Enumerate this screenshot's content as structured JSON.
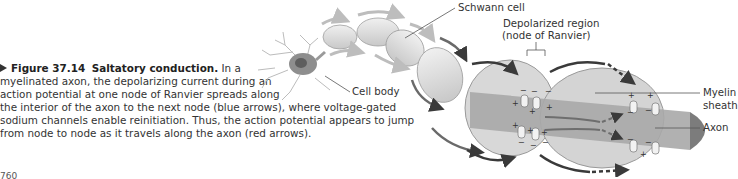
{
  "figure": {
    "number_label": "Figure 37.14",
    "title": "Saltatory conduction.",
    "caption_lines": [
      "In a",
      "myelinated axon, the depolarizing current during an",
      "action potential at one node of Ranvier spreads along",
      "the interior of the axon to the next node (blue arrows), where voltage-gated",
      "sodium channels enable reinitiation. Thus, the action potential appears to jump",
      "from node to node as it travels along the axon (red arrows)."
    ],
    "page_number": "760"
  },
  "diagram": {
    "labels": {
      "schwann_cell": "Schwann cell",
      "cell_body": "Cell body",
      "depolarized_region_1": "Depolarized region",
      "depolarized_region_2": "(node of Ranvier)",
      "myelin_sheath_1": "Myelin",
      "myelin_sheath_2": "sheath",
      "axon": "Axon"
    },
    "colors": {
      "myelin": "#d9d9d9",
      "axon": "#a8a8a8",
      "arrow_dark": "#3a3a3a",
      "arrow_light": "#bdbdbd"
    }
  }
}
